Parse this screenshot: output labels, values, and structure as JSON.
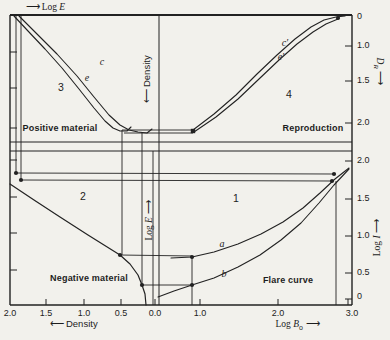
{
  "colors": {
    "ink": "#222222",
    "paper": "#f2f1ec"
  },
  "axes": {
    "top": {
      "arrow": "⟶",
      "pre": "Log ",
      "var": "E"
    },
    "bottom_left": {
      "arrow": "⟵",
      "label": "Density"
    },
    "bottom_right": {
      "pre": "Log ",
      "var": "B",
      "sub": "o",
      "arrow": "⟶"
    },
    "right_top": {
      "var": "D",
      "sub": "R",
      "arrow": "⟶"
    },
    "right_bottom": {
      "pre": "Log ",
      "var": "I",
      "arrow": "⟶"
    },
    "center_top": {
      "arrow": "⟵",
      "label": "Density"
    },
    "center_bottom": {
      "pre": "Log ",
      "var": "E",
      "arrow": "⟶"
    }
  },
  "quadrants": {
    "q1": "1",
    "q2": "2",
    "q3": "3",
    "q4": "4"
  },
  "regions": {
    "q3": "Positive material",
    "q4": "Reproduction",
    "q2": "Negative material",
    "q1": "Flare curve"
  },
  "curve_labels": {
    "c": "c",
    "e": "e",
    "c_prime": "c′",
    "e_prime": "e′",
    "a": "a",
    "b": "b"
  },
  "tick_labels": {
    "right": [
      {
        "t": "0",
        "y": 17
      },
      {
        "t": "1.0",
        "y": 46
      },
      {
        "t": "1.5",
        "y": 81
      },
      {
        "t": "2.0",
        "y": 123
      },
      {
        "t": "2.0",
        "y": 161
      },
      {
        "t": "1.5",
        "y": 199
      },
      {
        "t": "1.0",
        "y": 236
      },
      {
        "t": "0.5",
        "y": 273
      },
      {
        "t": "0",
        "y": 297
      }
    ],
    "bottom": [
      {
        "t": "2.0",
        "x": 10
      },
      {
        "t": "1.5",
        "x": 46
      },
      {
        "t": "1.0",
        "x": 84
      },
      {
        "t": "0.5",
        "x": 121
      },
      {
        "t": "0.0",
        "x": 155
      },
      {
        "t": "1.0",
        "x": 200
      },
      {
        "t": "2.0",
        "x": 278
      },
      {
        "t": "3.0",
        "x": 352
      }
    ]
  },
  "geometry": {
    "lines": [
      [
        10,
        15,
        352,
        15,
        1.8
      ],
      [
        10,
        305,
        352,
        305,
        1.4
      ],
      [
        10,
        15,
        10,
        305,
        1.4
      ],
      [
        352,
        15,
        352,
        305,
        1.4
      ],
      [
        10,
        142,
        352,
        142,
        1.1
      ],
      [
        10,
        151,
        352,
        151,
        1.1
      ],
      [
        16,
        15,
        16,
        173,
        0.9
      ],
      [
        21,
        15,
        21,
        180,
        0.9
      ],
      [
        122,
        130,
        122,
        255,
        0.9
      ],
      [
        142,
        132,
        142,
        285,
        0.9
      ],
      [
        153,
        151,
        153,
        305,
        0.9
      ],
      [
        159,
        15,
        159,
        305,
        1.0
      ],
      [
        192,
        257,
        192,
        305,
        0.9
      ],
      [
        336,
        181,
        336,
        305,
        0.9
      ],
      [
        16,
        173,
        334,
        174,
        0.9
      ],
      [
        21,
        180,
        332,
        181,
        0.9
      ],
      [
        122,
        130,
        193,
        130,
        0.9
      ],
      [
        124,
        133,
        193,
        133,
        0.9
      ],
      [
        120,
        255,
        192,
        256,
        0.9
      ],
      [
        142,
        285,
        192,
        285,
        0.9
      ],
      [
        10,
        52,
        17,
        52,
        1
      ],
      [
        10,
        88,
        17,
        88,
        1
      ],
      [
        10,
        128,
        17,
        128,
        1
      ],
      [
        10,
        160,
        17,
        160,
        1
      ],
      [
        10,
        197,
        17,
        197,
        1
      ],
      [
        10,
        233,
        17,
        233,
        1
      ],
      [
        10,
        270,
        17,
        270,
        1
      ],
      [
        345,
        46,
        352,
        46,
        1
      ],
      [
        345,
        81,
        352,
        81,
        1
      ],
      [
        345,
        123,
        352,
        123,
        1
      ],
      [
        345,
        161,
        352,
        161,
        1
      ],
      [
        345,
        199,
        352,
        199,
        1
      ],
      [
        345,
        236,
        352,
        236,
        1
      ],
      [
        345,
        273,
        352,
        273,
        1
      ],
      [
        345,
        299,
        352,
        299,
        1
      ],
      [
        46,
        299,
        46,
        305,
        1
      ],
      [
        84,
        299,
        84,
        305,
        1
      ],
      [
        121,
        299,
        121,
        305,
        1
      ],
      [
        155,
        299,
        155,
        305,
        1
      ],
      [
        200,
        299,
        200,
        305,
        1
      ],
      [
        278,
        299,
        278,
        305,
        1
      ],
      [
        348,
        299,
        348,
        305,
        1
      ]
    ],
    "curves": [
      {
        "name": "positive-e",
        "w": 1.1,
        "pts": [
          [
            14,
            16
          ],
          [
            28,
            31
          ],
          [
            45,
            49
          ],
          [
            62,
            68
          ],
          [
            79,
            89
          ],
          [
            94,
            108
          ],
          [
            105,
            121
          ],
          [
            113,
            128
          ],
          [
            120,
            131
          ],
          [
            127,
            131
          ],
          [
            131,
            127
          ]
        ]
      },
      {
        "name": "positive-c",
        "w": 1.1,
        "pts": [
          [
            19,
            16
          ],
          [
            37,
            34
          ],
          [
            57,
            54
          ],
          [
            77,
            76
          ],
          [
            94,
            97
          ],
          [
            109,
            115
          ],
          [
            120,
            125
          ],
          [
            129,
            130
          ],
          [
            138,
            132
          ],
          [
            147,
            133
          ],
          [
            152,
            129
          ]
        ]
      },
      {
        "name": "reproduction-c-prime",
        "w": 1.1,
        "pts": [
          [
            193,
            130
          ],
          [
            214,
            114
          ],
          [
            236,
            95
          ],
          [
            257,
            74
          ],
          [
            277,
            55
          ],
          [
            295,
            39
          ],
          [
            311,
            27
          ],
          [
            324,
            20
          ],
          [
            336,
            17
          ],
          [
            345,
            16
          ]
        ]
      },
      {
        "name": "reproduction-e-prime",
        "w": 1.1,
        "pts": [
          [
            194,
            132
          ],
          [
            216,
            117
          ],
          [
            238,
            99
          ],
          [
            259,
            79
          ],
          [
            279,
            60
          ],
          [
            297,
            44
          ],
          [
            313,
            32
          ],
          [
            326,
            24
          ],
          [
            338,
            19
          ]
        ]
      },
      {
        "name": "negative",
        "w": 1.2,
        "pts": [
          [
            10,
            184
          ],
          [
            34,
            200
          ],
          [
            60,
            217
          ],
          [
            88,
            235
          ],
          [
            120,
            255
          ],
          [
            130,
            264
          ],
          [
            138,
            275
          ],
          [
            142,
            285
          ],
          [
            145,
            294
          ],
          [
            146,
            305
          ]
        ]
      },
      {
        "name": "flare-a",
        "w": 1.1,
        "pts": [
          [
            171,
            258
          ],
          [
            192,
            257
          ],
          [
            214,
            252
          ],
          [
            238,
            244
          ],
          [
            261,
            234
          ],
          [
            283,
            222
          ],
          [
            303,
            208
          ],
          [
            320,
            193
          ],
          [
            335,
            179
          ],
          [
            349,
            168
          ]
        ]
      },
      {
        "name": "flare-b",
        "w": 1.1,
        "pts": [
          [
            158,
            297
          ],
          [
            174,
            291
          ],
          [
            192,
            285
          ],
          [
            214,
            278
          ],
          [
            238,
            267
          ],
          [
            260,
            255
          ],
          [
            281,
            240
          ],
          [
            301,
            223
          ],
          [
            319,
            203
          ],
          [
            334,
            185
          ],
          [
            349,
            169
          ]
        ]
      }
    ],
    "dots": [
      [
        16,
        173
      ],
      [
        21,
        180
      ],
      [
        120,
        255
      ],
      [
        142,
        285
      ],
      [
        192,
        257
      ],
      [
        192,
        285
      ],
      [
        338,
        18
      ],
      [
        334,
        174
      ],
      [
        332,
        181
      ]
    ],
    "square_dots": [
      [
        193,
        131
      ]
    ]
  }
}
